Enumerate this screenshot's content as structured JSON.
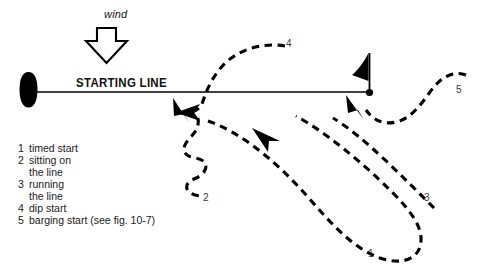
{
  "figure": {
    "background": "#ffffff",
    "ink": "#000000"
  },
  "wind": {
    "label": "wind",
    "direction": "down",
    "arrow_icon": "hollow-down-arrow"
  },
  "start_line": {
    "label": "STARTING LINE",
    "left_end_icon": "committee-boat-hull",
    "right_end_icon": "mark-buoy-dot",
    "flag_icon": "pennant-flag"
  },
  "path_labels": [
    {
      "id": "1",
      "text": "1"
    },
    {
      "id": "2",
      "text": "2"
    },
    {
      "id": "3",
      "text": "3"
    },
    {
      "id": "4",
      "text": "4"
    },
    {
      "id": "5",
      "text": "5"
    }
  ],
  "legend": {
    "entries": [
      {
        "num": "1",
        "lines": [
          "timed start"
        ]
      },
      {
        "num": "2",
        "lines": [
          "sitting on",
          "the line"
        ]
      },
      {
        "num": "3",
        "lines": [
          "running",
          "the line"
        ]
      },
      {
        "num": "4",
        "lines": [
          "dip start"
        ]
      },
      {
        "num": "5",
        "lines": [
          "barging start (see fig. 10-7)"
        ]
      }
    ]
  }
}
